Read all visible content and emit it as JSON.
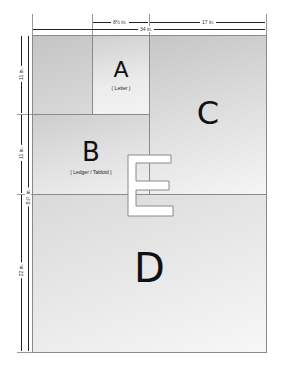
{
  "diagram": {
    "title": "",
    "dimensions": {
      "top_a_width": "8½ in.",
      "top_c_width": "17 in.",
      "top_total_width": "34 in.",
      "left_a_height": "11 in.",
      "left_b_height": "11 in.",
      "left_b_small": "8½ in.",
      "left_d_height": "22 in."
    },
    "sheets": [
      {
        "letter": "A",
        "label": "( Letter )"
      },
      {
        "letter": "B",
        "label": "( Ledger / Tabloid )"
      },
      {
        "letter": "C",
        "label": ""
      },
      {
        "letter": "D",
        "label": ""
      },
      {
        "letter": "E",
        "label": ""
      }
    ],
    "colors": {
      "sheet_gray_dark": "#c4c4c4",
      "sheet_gray_light": "#f2f2f2",
      "border": "#8a8a8a",
      "text": "#111111"
    }
  }
}
